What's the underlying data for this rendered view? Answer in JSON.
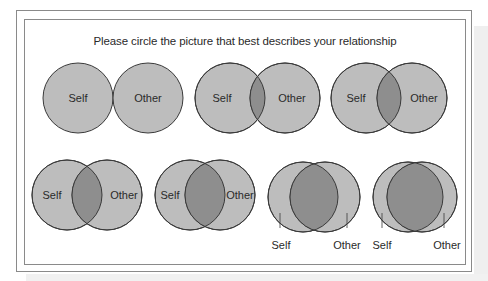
{
  "title": "Please circle the picture that best describes your relationship",
  "labels": {
    "self": "Self",
    "other": "Other"
  },
  "colors": {
    "circle_fill": "#bdbdbd",
    "overlap_fill": "#8e8e8e",
    "stroke": "#3a3a3a",
    "frame": "#8a8a8a"
  },
  "diagrams": [
    {
      "id": 1,
      "overlap": "none (touching)",
      "self_cx": 78,
      "other_cx": 148,
      "cy": 98,
      "r": 35,
      "label_style": "inside"
    },
    {
      "id": 2,
      "overlap": "small",
      "self_cx": 230,
      "other_cx": 285,
      "cy": 98,
      "r": 35,
      "label_style": "inside"
    },
    {
      "id": 3,
      "overlap": "small-medium",
      "self_cx": 366,
      "other_cx": 412,
      "cy": 98,
      "r": 35,
      "label_style": "inside"
    },
    {
      "id": 4,
      "overlap": "medium",
      "self_cx": 67,
      "other_cx": 107,
      "cy": 195,
      "r": 35,
      "label_style": "inside"
    },
    {
      "id": 5,
      "overlap": "medium-large",
      "self_cx": 190,
      "other_cx": 220,
      "cy": 195,
      "r": 35,
      "label_style": "inside"
    },
    {
      "id": 6,
      "overlap": "large",
      "self_cx": 303,
      "other_cx": 325,
      "cy": 197,
      "r": 35,
      "label_style": "below"
    },
    {
      "id": 7,
      "overlap": "very large",
      "self_cx": 408,
      "other_cx": 422,
      "cy": 197,
      "r": 35,
      "label_style": "below"
    }
  ]
}
